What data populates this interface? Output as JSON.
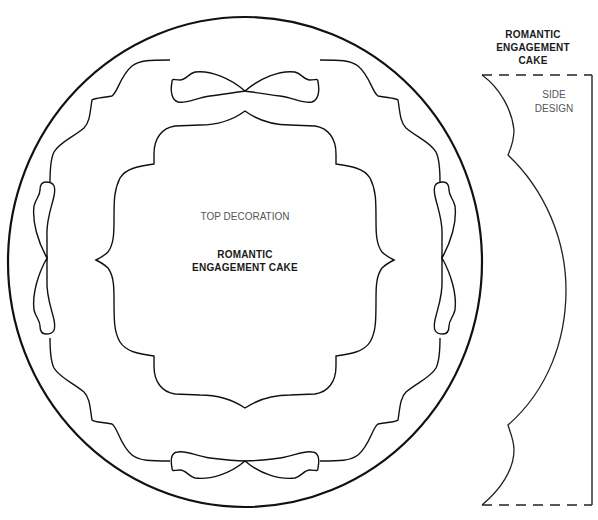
{
  "diagram": {
    "top_view": {
      "section_label": "TOP DECORATION",
      "title_line1": "ROMANTIC",
      "title_line2": "ENGAGEMENT CAKE"
    },
    "side_view": {
      "title_line1": "ROMANTIC",
      "title_line2": "ENGAGEMENT",
      "title_line3": "CAKE",
      "section_label_line1": "SIDE",
      "section_label_line2": "DESIGN"
    },
    "colors": {
      "line": "#111111",
      "text": "#1a1a1a",
      "subtext": "#555555",
      "background": "#ffffff"
    }
  }
}
